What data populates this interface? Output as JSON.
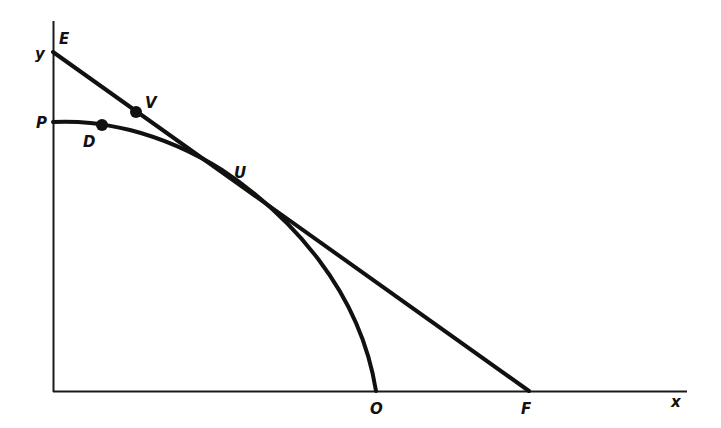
{
  "diagram": {
    "type": "production-possibility-with-budget-line",
    "axes": {
      "x_label": "x",
      "y_label": "y"
    },
    "points": {
      "E": {
        "label": "E",
        "desc": "intercept of straight line on y-axis"
      },
      "P": {
        "label": "P",
        "desc": "intercept of curve on y-axis"
      },
      "D": {
        "label": "D",
        "desc": "point on curve"
      },
      "V": {
        "label": "V",
        "desc": "point on straight line"
      },
      "U": {
        "label": "U",
        "desc": "tangency point of line and curve"
      },
      "O": {
        "label": "O",
        "desc": "intercept of curve on x-axis"
      },
      "F": {
        "label": "F",
        "desc": "intercept of straight line on x-axis"
      }
    },
    "elements": [
      {
        "name": "straight line EF",
        "from": "E",
        "to": "F",
        "tangent_at": "U"
      },
      {
        "name": "concave curve PO",
        "from": "P",
        "to": "O",
        "through": [
          "D",
          "U"
        ]
      }
    ],
    "stroke_color": "#111111",
    "background": "#ffffff"
  }
}
